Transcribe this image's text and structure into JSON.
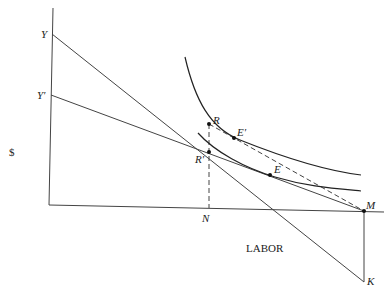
{
  "diagram": {
    "y_axis_label": "$",
    "x_axis_label": "LABOR",
    "points": {
      "Y": "Y",
      "Y_prime": "Y′",
      "R": "R",
      "R_prime": "R′",
      "E": "E",
      "E_prime": "E′",
      "N": "N",
      "M": "M",
      "K": "K"
    },
    "colors": {
      "line": "#444444",
      "curve": "#222222",
      "background": "#ffffff"
    }
  }
}
